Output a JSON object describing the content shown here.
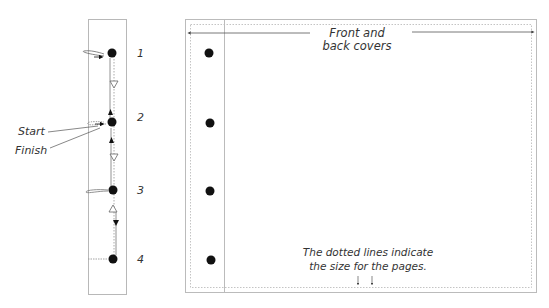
{
  "colors": {
    "ink": "#111111",
    "frame": "#b8b8b8",
    "dotted": "#bdbdbd",
    "text": "#333333",
    "guide": "#555555"
  },
  "binding_strip": {
    "holes": [
      {
        "number": "1"
      },
      {
        "number": "2"
      },
      {
        "number": "3"
      },
      {
        "number": "4"
      }
    ],
    "start_label": "Start",
    "finish_label": "Finish"
  },
  "cover": {
    "title_line1": "Front and",
    "title_line2": "back covers",
    "note_line1": "The dotted lines indicate",
    "note_line2": "the size for the pages."
  }
}
